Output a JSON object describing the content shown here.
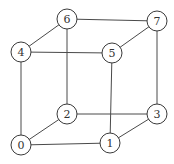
{
  "diagram": {
    "type": "graph",
    "node_radius": 10,
    "colors": {
      "edge": "#4a4a4a",
      "node_stroke": "#3a3a3a",
      "node_fill": "#ffffff",
      "label": "#333333",
      "background": "#ffffff"
    },
    "nodes": [
      {
        "id": "0",
        "label": "0",
        "x": 21,
        "y": 145
      },
      {
        "id": "1",
        "label": "1",
        "x": 110,
        "y": 143
      },
      {
        "id": "2",
        "label": "2",
        "x": 67,
        "y": 114
      },
      {
        "id": "3",
        "label": "3",
        "x": 157,
        "y": 114
      },
      {
        "id": "4",
        "label": "4",
        "x": 21,
        "y": 52
      },
      {
        "id": "5",
        "label": "5",
        "x": 112,
        "y": 53
      },
      {
        "id": "6",
        "label": "6",
        "x": 67,
        "y": 19
      },
      {
        "id": "7",
        "label": "7",
        "x": 157,
        "y": 21
      }
    ],
    "edges": [
      [
        "0",
        "1"
      ],
      [
        "0",
        "2"
      ],
      [
        "0",
        "4"
      ],
      [
        "1",
        "3"
      ],
      [
        "1",
        "5"
      ],
      [
        "2",
        "3"
      ],
      [
        "2",
        "6"
      ],
      [
        "3",
        "7"
      ],
      [
        "4",
        "5"
      ],
      [
        "4",
        "6"
      ],
      [
        "5",
        "7"
      ],
      [
        "6",
        "7"
      ]
    ]
  }
}
